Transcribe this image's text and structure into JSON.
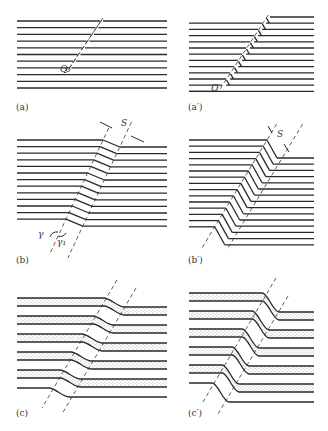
{
  "figure": {
    "panels": [
      {
        "id": "a",
        "label": "(a)",
        "point_label": "Q",
        "line_count": 11
      },
      {
        "id": "a_prime",
        "label": "(a′)",
        "point_label": "Q",
        "line_count": 13
      },
      {
        "id": "b",
        "label": "(b)",
        "band_width_label": "S",
        "angle_labels": [
          "γ",
          "γ₁"
        ],
        "line_count": 13
      },
      {
        "id": "b_prime",
        "label": "(b′)",
        "band_width_label": "S",
        "line_count": 15
      },
      {
        "id": "c",
        "label": "(c)",
        "description": "dotted layers offset across band"
      },
      {
        "id": "c_prime",
        "label": "(c′)",
        "description": "dotted layers flexed across band"
      }
    ],
    "colors": {
      "line": "#2a2a2a",
      "background": "#ffffff",
      "stipple": "#555555"
    }
  }
}
